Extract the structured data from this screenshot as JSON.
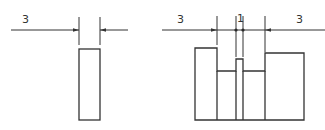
{
  "figures": [
    {
      "name": "single-slot",
      "dimension_labels": [
        {
          "text": "3",
          "x": 25,
          "y": 23
        }
      ]
    },
    {
      "name": "stepped-groove",
      "dimension_labels": [
        {
          "text": "3",
          "x": 180,
          "y": 23
        },
        {
          "text": "1",
          "x": 239,
          "y": 22
        },
        {
          "text": "3",
          "x": 299,
          "y": 23
        }
      ]
    }
  ],
  "colors": {
    "line": "#333333",
    "background": "#ffffff"
  }
}
